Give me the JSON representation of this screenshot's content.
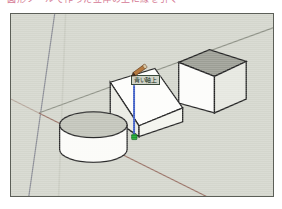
{
  "caption": {
    "text": "図形ツールで作った立体の上に線を引く"
  },
  "viewport": {
    "name": "sketchup-modeling-viewport",
    "background_color": "#d4d6cd",
    "border_color": "#5c5f58",
    "width": 264,
    "height": 184
  },
  "axes": {
    "origin": {
      "x": 28,
      "y": 100
    },
    "red_axis": {
      "label": "red-axis",
      "color": "#9a7468",
      "from": {
        "x": 28,
        "y": 100
      },
      "to": {
        "x": 196,
        "y": 184
      }
    },
    "red_axis_back": {
      "label": "red-axis-negative",
      "color": "#b5a79c",
      "from": {
        "x": 28,
        "y": 100
      },
      "to": {
        "x": 0,
        "y": 86
      }
    },
    "green_axis": {
      "label": "green-axis",
      "color": "#8e9186",
      "from": {
        "x": 28,
        "y": 100
      },
      "to": {
        "x": 264,
        "y": 14
      }
    },
    "blue_axis": {
      "label": "blue-axis",
      "color": "#8a8c95",
      "from": {
        "x": 44,
        "y": 0
      },
      "to": {
        "x": 18,
        "y": 184
      }
    },
    "ground_guide": {
      "label": "ground-guide-line",
      "color": "#c9cbc1",
      "from": {
        "x": 55,
        "y": 0
      },
      "to": {
        "x": 48,
        "y": 184
      }
    }
  },
  "shapes": [
    {
      "id": "cylinder",
      "name": "cylinder-solid",
      "description": "Extruded circle standing on the ground plane",
      "top_face_color": "#c2c4ba",
      "side_face_color": "#fbfbf8",
      "edge_color": "#2b2b2b",
      "center": {
        "x": 83,
        "y": 122
      },
      "radius_x": 34,
      "radius_y": 13,
      "height": 32
    },
    {
      "id": "wedge",
      "name": "wedge-ramp-solid",
      "description": "Ramp / wedge shape with sloped top face where the line is drawn",
      "top_face_color": "#fdfdfb",
      "left_face_color": "#e9eae3",
      "front_face_color": "#f6f6f2",
      "edge_color": "#242424"
    },
    {
      "id": "cube",
      "name": "cube-solid",
      "description": "Box / cube floating at upper right",
      "top_face_color": "#9c9e95",
      "left_face_color": "#fcfcfa",
      "right_face_color": "#e4e5de",
      "edge_color": "#232323"
    }
  ],
  "drawing": {
    "active_line": {
      "name": "blue-axis-constrained-line",
      "color": "#3f5ec6",
      "from": {
        "x": 124,
        "y": 62
      },
      "to": {
        "x": 124,
        "y": 124
      },
      "thickness": 2
    },
    "endpoint": {
      "name": "endpoint-inference-marker",
      "color": "#18a02b",
      "x": 124,
      "y": 124,
      "size": 5
    }
  },
  "tooltip": {
    "name": "inference-tooltip",
    "text": "青い軸上",
    "background": "#cfd2c6",
    "border": "#3a4a3a",
    "text_color": "#17301b"
  },
  "cursor": {
    "name": "pencil-tool-cursor",
    "tool": "line-tool",
    "body_color": "#b5793f",
    "tip_color": "#4a3322",
    "ferrule_color": "#d9c9a6"
  }
}
